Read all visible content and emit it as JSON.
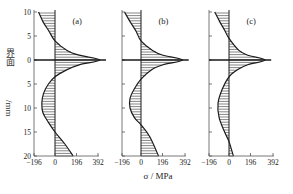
{
  "chart_data": [
    {
      "type": "area",
      "panel": "(a)",
      "title": "(a)",
      "xlabel": "σ / MPa",
      "ylabel": "界面 /mm",
      "x_ticks": [
        -196,
        0,
        196,
        392
      ],
      "y_ticks": [
        10,
        5,
        0,
        5,
        10,
        15,
        20
      ],
      "xlim": [
        -196,
        392
      ],
      "ylim_mm": [
        -10,
        20
      ],
      "interface_at": 0,
      "points": [
        {
          "depth": -10,
          "stress": -150
        },
        {
          "depth": -8,
          "stress": -110
        },
        {
          "depth": -6,
          "stress": -55
        },
        {
          "depth": -4,
          "stress": 0
        },
        {
          "depth": -2,
          "stress": 110
        },
        {
          "depth": -1,
          "stress": 220
        },
        {
          "depth": 0,
          "stress": 410
        },
        {
          "depth": 1,
          "stress": 220
        },
        {
          "depth": 2,
          "stress": 110
        },
        {
          "depth": 3.5,
          "stress": 0
        },
        {
          "depth": 5,
          "stress": -60
        },
        {
          "depth": 7,
          "stress": -105
        },
        {
          "depth": 9,
          "stress": -120
        },
        {
          "depth": 11,
          "stress": -110
        },
        {
          "depth": 13,
          "stress": -60
        },
        {
          "depth": 15,
          "stress": 0
        },
        {
          "depth": 17.5,
          "stress": 90
        },
        {
          "depth": 20,
          "stress": 165
        }
      ]
    },
    {
      "type": "area",
      "panel": "(b)",
      "title": "(b)",
      "xlabel": "σ / MPa",
      "x_ticks": [
        -196,
        0,
        196,
        392
      ],
      "xlim": [
        -196,
        392
      ],
      "ylim_mm": [
        -10,
        20
      ],
      "points": [
        {
          "depth": -10,
          "stress": -150
        },
        {
          "depth": -8,
          "stress": -100
        },
        {
          "depth": -6,
          "stress": -45
        },
        {
          "depth": -4,
          "stress": 0
        },
        {
          "depth": -2,
          "stress": 105
        },
        {
          "depth": -1,
          "stress": 200
        },
        {
          "depth": 0,
          "stress": 380
        },
        {
          "depth": 1,
          "stress": 200
        },
        {
          "depth": 2,
          "stress": 100
        },
        {
          "depth": 4,
          "stress": 0
        },
        {
          "depth": 6,
          "stress": -60
        },
        {
          "depth": 8,
          "stress": -100
        },
        {
          "depth": 10,
          "stress": -100
        },
        {
          "depth": 12,
          "stress": -60
        },
        {
          "depth": 13.5,
          "stress": 0
        },
        {
          "depth": 16,
          "stress": 80
        },
        {
          "depth": 20,
          "stress": 160
        }
      ]
    },
    {
      "type": "area",
      "panel": "(c)",
      "title": "(c)",
      "xlabel": "σ / MPa",
      "x_ticks": [
        -196,
        0,
        196,
        392
      ],
      "xlim": [
        -196,
        392
      ],
      "ylim_mm": [
        -10,
        20
      ],
      "points": [
        {
          "depth": -10,
          "stress": -130
        },
        {
          "depth": -8,
          "stress": -85
        },
        {
          "depth": -6,
          "stress": -35
        },
        {
          "depth": -4.5,
          "stress": 0
        },
        {
          "depth": -2,
          "stress": 90
        },
        {
          "depth": -1,
          "stress": 170
        },
        {
          "depth": 0,
          "stress": 330
        },
        {
          "depth": 1,
          "stress": 170
        },
        {
          "depth": 2,
          "stress": 80
        },
        {
          "depth": 3.5,
          "stress": 0
        },
        {
          "depth": 6,
          "stress": -60
        },
        {
          "depth": 9,
          "stress": -100
        },
        {
          "depth": 12,
          "stress": -90
        },
        {
          "depth": 15,
          "stress": -40
        },
        {
          "depth": 17,
          "stress": 0
        },
        {
          "depth": 20,
          "stress": 40
        }
      ]
    }
  ],
  "labels": {
    "panel_a": "(a)",
    "panel_b": "(b)",
    "panel_c": "(c)",
    "xlabel": "σ / MPa",
    "ylabel_top": "界面",
    "ylabel_bottom": "/mm",
    "x_tick_labels": [
      "−196",
      "0",
      "196",
      "392"
    ],
    "y_tick_labels": [
      "10",
      "5",
      "0",
      "5",
      "10",
      "15",
      "20"
    ]
  },
  "colors": {
    "line": "#1a1a1a",
    "hatch": "#333333",
    "background": "#ffffff"
  }
}
